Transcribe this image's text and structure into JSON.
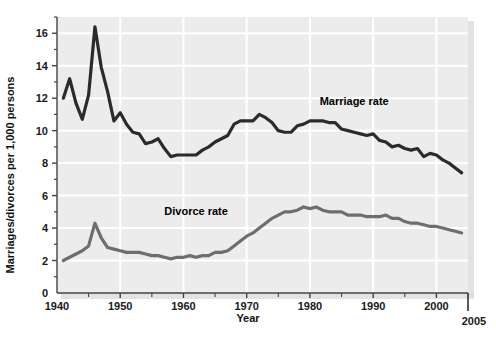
{
  "chart_data": {
    "type": "line",
    "title": "",
    "xlabel": "Year",
    "ylabel": "Marriages/divorces per 1,000 persons",
    "xlim": [
      1940,
      2005
    ],
    "ylim": [
      0,
      17
    ],
    "grid": true,
    "legend_position": "inline-annotations",
    "x_ticks": [
      1940,
      1950,
      1960,
      1970,
      1980,
      1990,
      2000
    ],
    "x_tick_labels": [
      "1940",
      "1950",
      "1960",
      "1970",
      "1980",
      "1990",
      "2000"
    ],
    "x_minor_ticks": [
      1945,
      1955,
      1965,
      1975,
      1985,
      1995
    ],
    "x_end_tick": 2005,
    "x_end_label": "2005",
    "y_ticks": [
      0,
      2,
      4,
      6,
      8,
      10,
      12,
      14,
      16
    ],
    "y_tick_labels": [
      "0",
      "2",
      "4",
      "6",
      "8",
      "10",
      "12",
      "14",
      "16"
    ],
    "x": [
      1941,
      1942,
      1943,
      1944,
      1945,
      1946,
      1947,
      1948,
      1949,
      1950,
      1951,
      1952,
      1953,
      1954,
      1955,
      1956,
      1957,
      1958,
      1959,
      1960,
      1961,
      1962,
      1963,
      1964,
      1965,
      1966,
      1967,
      1968,
      1969,
      1970,
      1971,
      1972,
      1973,
      1974,
      1975,
      1976,
      1977,
      1978,
      1979,
      1980,
      1981,
      1982,
      1983,
      1984,
      1985,
      1986,
      1987,
      1988,
      1989,
      1990,
      1991,
      1992,
      1993,
      1994,
      1995,
      1996,
      1997,
      1998,
      1999,
      2000,
      2001,
      2002,
      2003,
      2004
    ],
    "series": [
      {
        "name": "Marriage rate",
        "color": "#2b2b2b",
        "label_x": 1987,
        "label_y": 11.6,
        "values": [
          12.0,
          13.2,
          11.7,
          10.7,
          12.2,
          16.4,
          13.9,
          12.4,
          10.6,
          11.1,
          10.4,
          9.9,
          9.8,
          9.2,
          9.3,
          9.5,
          8.9,
          8.4,
          8.5,
          8.5,
          8.5,
          8.5,
          8.8,
          9.0,
          9.3,
          9.5,
          9.7,
          10.4,
          10.6,
          10.6,
          10.6,
          11.0,
          10.8,
          10.5,
          10.0,
          9.9,
          9.9,
          10.3,
          10.4,
          10.6,
          10.6,
          10.6,
          10.5,
          10.5,
          10.1,
          10.0,
          9.9,
          9.8,
          9.7,
          9.8,
          9.4,
          9.3,
          9.0,
          9.1,
          8.9,
          8.8,
          8.9,
          8.4,
          8.6,
          8.5,
          8.2,
          8.0,
          7.7,
          7.4
        ]
      },
      {
        "name": "Divorce rate",
        "color": "#6e6e6e",
        "label_x": 1962,
        "label_y": 4.8,
        "values": [
          2.0,
          2.2,
          2.4,
          2.6,
          2.9,
          4.3,
          3.4,
          2.8,
          2.7,
          2.6,
          2.5,
          2.5,
          2.5,
          2.4,
          2.3,
          2.3,
          2.2,
          2.1,
          2.2,
          2.2,
          2.3,
          2.2,
          2.3,
          2.3,
          2.5,
          2.5,
          2.6,
          2.9,
          3.2,
          3.5,
          3.7,
          4.0,
          4.3,
          4.6,
          4.8,
          5.0,
          5.0,
          5.1,
          5.3,
          5.2,
          5.3,
          5.1,
          5.0,
          5.0,
          5.0,
          4.8,
          4.8,
          4.8,
          4.7,
          4.7,
          4.7,
          4.8,
          4.6,
          4.6,
          4.4,
          4.3,
          4.3,
          4.2,
          4.1,
          4.1,
          4.0,
          3.9,
          3.8,
          3.7
        ]
      }
    ]
  },
  "plot": {
    "background_color": "#ececec",
    "gridline_color": "#ffffff",
    "axis_color": "#444444",
    "page_background": "#ffffff"
  }
}
